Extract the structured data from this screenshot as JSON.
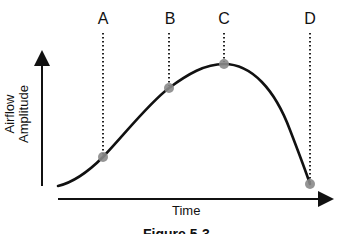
{
  "diagram": {
    "y_axis_label_line1": "Airflow",
    "y_axis_label_line2": "Amplitude",
    "x_axis_label": "Time",
    "caption": "Figure 5-3",
    "markers": [
      {
        "label": "A",
        "x": 103,
        "y": 157
      },
      {
        "label": "B",
        "x": 169,
        "y": 88
      },
      {
        "label": "C",
        "x": 224,
        "y": 64
      },
      {
        "label": "D",
        "x": 310,
        "y": 184
      }
    ],
    "colors": {
      "curve": "#111111",
      "marker_fill": "#8a8a8a",
      "axis": "#111111",
      "guide_line": "#222222"
    }
  }
}
